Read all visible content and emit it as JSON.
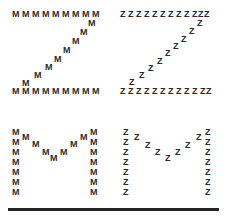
{
  "figure": {
    "background_color": "#ffffff",
    "letter_color": "#2b2b2b",
    "rule_color": "#262626"
  },
  "stimuli": [
    {
      "id": "top-left",
      "quadrant": "top-left",
      "global_letter": "Z",
      "local_letter": "M",
      "congruency": "incongruent",
      "origin": [
        0,
        0
      ]
    },
    {
      "id": "top-right",
      "quadrant": "top-right",
      "global_letter": "Z",
      "local_letter": "Z",
      "congruency": "congruent",
      "origin": [
        113,
        0
      ]
    },
    {
      "id": "bottom-left",
      "quadrant": "bottom-left",
      "global_letter": "M",
      "local_letter": "M",
      "congruency": "congruent",
      "origin": [
        0,
        110
      ]
    },
    {
      "id": "bottom-right",
      "quadrant": "bottom-right",
      "global_letter": "M",
      "local_letter": "Z",
      "congruency": "incongruent",
      "origin": [
        113,
        110
      ]
    }
  ],
  "glyph_layouts": {
    "Z-wide": {
      "note": "Global Z built from a top row, a descending diagonal, and a bottom row. Coordinates are local-letter top-left positions in px relative to the quadrant.",
      "positions": [
        [
          12,
          10
        ],
        [
          22,
          10
        ],
        [
          32,
          10
        ],
        [
          42,
          10
        ],
        [
          52,
          10
        ],
        [
          62,
          10
        ],
        [
          72,
          10
        ],
        [
          82,
          10
        ],
        [
          92,
          10
        ],
        [
          88,
          19
        ],
        [
          80,
          28
        ],
        [
          72,
          37
        ],
        [
          63,
          46
        ],
        [
          54,
          55
        ],
        [
          45,
          63
        ],
        [
          34,
          71
        ],
        [
          22,
          79
        ],
        [
          12,
          87
        ],
        [
          22,
          87
        ],
        [
          32,
          87
        ],
        [
          42,
          87
        ],
        [
          52,
          87
        ],
        [
          62,
          87
        ],
        [
          72,
          87
        ],
        [
          82,
          87
        ],
        [
          92,
          87
        ]
      ]
    },
    "Z-narrow": {
      "note": "Global Z built from narrower local Z glyphs, so rows hold more letters.",
      "positions": [
        [
          7,
          10
        ],
        [
          15,
          10
        ],
        [
          23,
          10
        ],
        [
          31,
          10
        ],
        [
          39,
          10
        ],
        [
          47,
          10
        ],
        [
          55,
          10
        ],
        [
          63,
          10
        ],
        [
          71,
          10
        ],
        [
          79,
          10
        ],
        [
          85,
          10
        ],
        [
          91,
          10
        ],
        [
          84,
          19
        ],
        [
          76,
          27
        ],
        [
          68,
          35
        ],
        [
          60,
          42
        ],
        [
          52,
          49
        ],
        [
          44,
          57
        ],
        [
          35,
          64
        ],
        [
          26,
          71
        ],
        [
          16,
          78
        ],
        [
          7,
          87
        ],
        [
          15,
          87
        ],
        [
          23,
          87
        ],
        [
          31,
          87
        ],
        [
          39,
          87
        ],
        [
          47,
          87
        ],
        [
          55,
          87
        ],
        [
          63,
          87
        ],
        [
          71,
          87
        ],
        [
          79,
          87
        ],
        [
          87,
          87
        ],
        [
          93,
          87
        ]
      ]
    },
    "M-wide": {
      "note": "Global M: left stem, descending-left diagonal, ascending-right diagonal, right stem.",
      "positions": [
        [
          12,
          18
        ],
        [
          12,
          28
        ],
        [
          12,
          38
        ],
        [
          12,
          48
        ],
        [
          12,
          58
        ],
        [
          12,
          68
        ],
        [
          12,
          78
        ],
        [
          22,
          23
        ],
        [
          32,
          30
        ],
        [
          42,
          38
        ],
        [
          50,
          44
        ],
        [
          60,
          38
        ],
        [
          70,
          30
        ],
        [
          80,
          23
        ],
        [
          90,
          18
        ],
        [
          90,
          28
        ],
        [
          90,
          38
        ],
        [
          90,
          48
        ],
        [
          90,
          58
        ],
        [
          90,
          68
        ],
        [
          90,
          78
        ]
      ]
    },
    "M-narrow": {
      "note": "Global M made of narrower local Z glyphs.",
      "positions": [
        [
          10,
          18
        ],
        [
          10,
          28
        ],
        [
          10,
          38
        ],
        [
          10,
          48
        ],
        [
          10,
          58
        ],
        [
          10,
          68
        ],
        [
          10,
          78
        ],
        [
          21,
          23
        ],
        [
          32,
          31
        ],
        [
          42,
          38
        ],
        [
          52,
          44
        ],
        [
          62,
          38
        ],
        [
          72,
          31
        ],
        [
          83,
          23
        ],
        [
          92,
          18
        ],
        [
          92,
          28
        ],
        [
          92,
          38
        ],
        [
          92,
          48
        ],
        [
          92,
          58
        ],
        [
          92,
          68
        ],
        [
          92,
          78
        ]
      ]
    }
  },
  "baseline_rule": {
    "visible": true,
    "x": 8,
    "y": 208,
    "width": 211,
    "height": 3
  }
}
